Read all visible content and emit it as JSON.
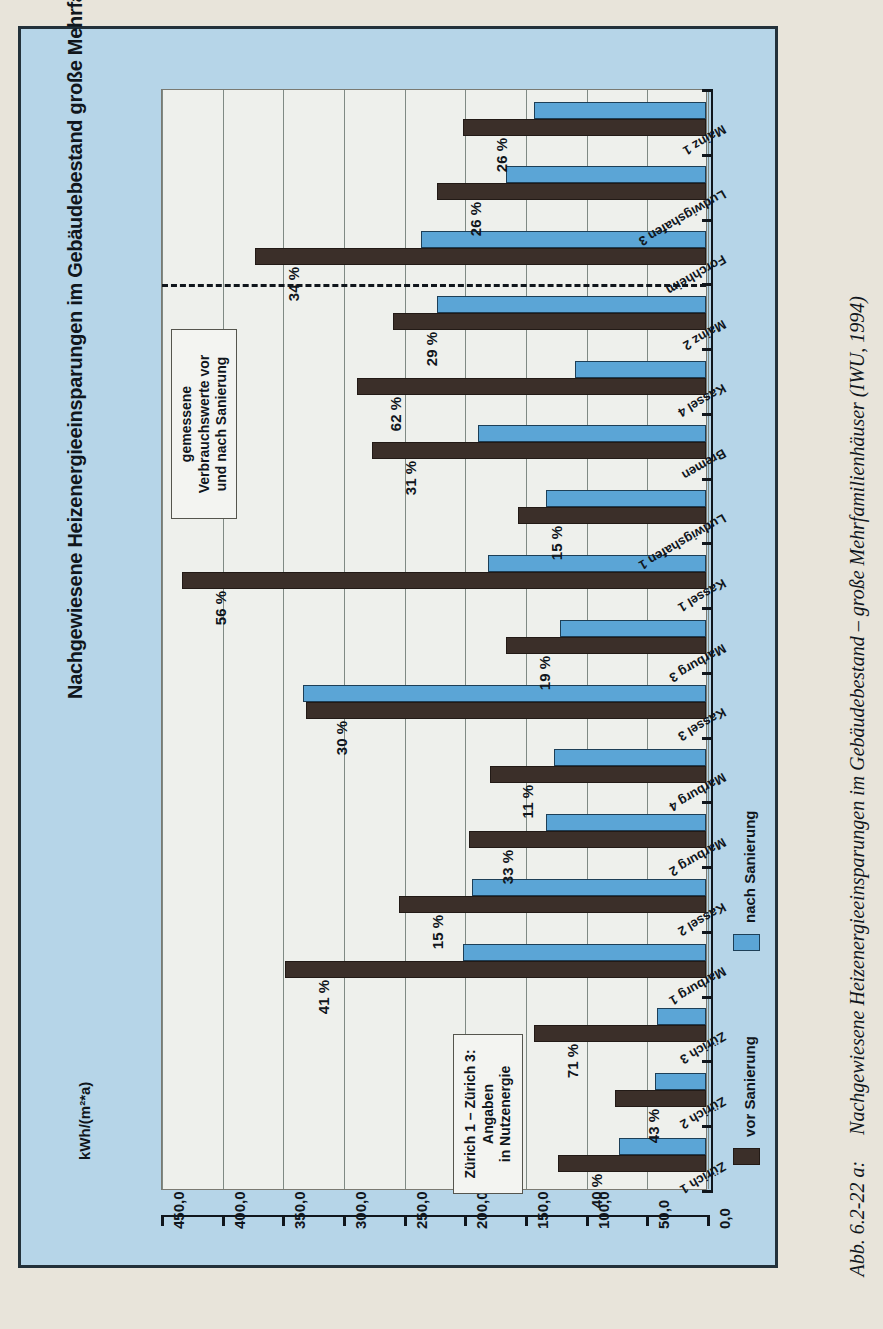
{
  "chart_data": {
    "type": "bar",
    "title": "Nachgewiesene Heizenergieeinsparungen im Gebäudebestand große Mehrfamilienhäuser",
    "xlabel": "",
    "ylabel": "kWh/(m²*a)",
    "ylim": [
      0,
      450
    ],
    "grid": true,
    "orientation": "horizontal",
    "legend_position": "bottom-right",
    "tick_labels": [
      "450,0",
      "400,0",
      "350,0",
      "300,0",
      "250,0",
      "200,0",
      "150,0",
      "100,0",
      "50,0",
      "0,0"
    ],
    "tick_values": [
      450,
      400,
      350,
      300,
      250,
      200,
      150,
      100,
      50,
      0
    ],
    "categories": [
      "Zürich 1",
      "Zürich 2",
      "Zürich 3",
      "Marburg 1",
      "Kassel 2",
      "Marburg 2",
      "Marburg 4",
      "Kassel 3",
      "Marburg 3",
      "Kassel 1",
      "Ludwigshafen 1",
      "Bremen",
      "Kassel 4",
      "Mainz 2",
      "Forchheim",
      "Ludwigshafen 3",
      "Mainz 1"
    ],
    "series": [
      {
        "name": "vor Sanierung",
        "color": "#3b2f29",
        "values": [
          122,
          75,
          142,
          347,
          253,
          195,
          178,
          330,
          165,
          432,
          155,
          275,
          288,
          258,
          372,
          222,
          200
        ]
      },
      {
        "name": "nach Sanierung",
        "color": "#5ba5d6",
        "values": [
          72,
          42,
          40,
          200,
          193,
          132,
          125,
          332,
          120,
          180,
          132,
          188,
          108,
          222,
          235,
          165,
          142
        ]
      }
    ],
    "savings_labels": [
      "40 %",
      "43 %",
      "71 %",
      "41 %",
      "15 %",
      "33 %",
      "11 %",
      "30 %",
      "19 %",
      "56 %",
      "15 %",
      "31 %",
      "62 %",
      "29 %",
      "34 %",
      "26 %",
      "26 %"
    ],
    "annotations": [
      {
        "name": "measured-values-note",
        "lines": [
          "gemessene",
          "Verbrauchswerte vor",
          "und nach Sanierung"
        ]
      },
      {
        "name": "zurich-note",
        "lines": [
          "Zürich 1 – Zürich 3:",
          "Angaben",
          "in Nutzenergie"
        ]
      }
    ],
    "separator": {
      "after_category": "Mainz 2",
      "style": "dashed"
    }
  },
  "legend": {
    "items": [
      {
        "label": "vor Sanierung",
        "color": "#3b2f29"
      },
      {
        "label": "nach Sanierung",
        "color": "#5ba5d6"
      }
    ]
  },
  "caption": {
    "label": "Abb. 6.2-22 a:",
    "text": "Nachgewiesene Heizenergieeinsparungen im Gebäudebestand – große Mehrfamilienhäuser (IWU, 1994)"
  }
}
